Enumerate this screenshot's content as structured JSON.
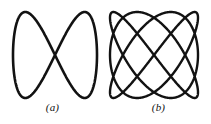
{
  "figure": {
    "background_color": "#ffffff",
    "stroke_color": "#121212",
    "panels": [
      {
        "id": "a",
        "caption": "(a)",
        "description": "figure-eight Lissajous curve",
        "stroke_width": 2.6
      },
      {
        "id": "b",
        "caption": "(b)",
        "description": "multi-loop Lissajous curve",
        "stroke_width": 2.4
      }
    ]
  },
  "chart_data": [
    {
      "type": "line",
      "title": "(a)",
      "xlabel": "",
      "ylabel": "",
      "xlim": [
        -1,
        1
      ],
      "ylim": [
        -1,
        1
      ],
      "grid": false,
      "legend": "none",
      "parametric": {
        "form": "lissajous",
        "x": "A*sin(a*t + delta)",
        "y": "B*sin(b*t)",
        "a": 1,
        "b": 2,
        "delta": 0,
        "frequency_ratio": "1:2",
        "amplitude_x": 1.0,
        "amplitude_y": 1.0,
        "t_range": [
          0,
          6.2832
        ],
        "crossings": 1
      }
    },
    {
      "type": "line",
      "title": "(b)",
      "xlabel": "",
      "ylabel": "",
      "xlim": [
        -1,
        1
      ],
      "ylim": [
        -1,
        1
      ],
      "grid": false,
      "legend": "none",
      "parametric": {
        "form": "lissajous",
        "x": "A*sin(a*t + delta)",
        "y": "B*sin(b*t)",
        "a": 3,
        "b": 4,
        "delta": 1.5708,
        "frequency_ratio": "3:4",
        "amplitude_x": 1.0,
        "amplitude_y": 1.0,
        "t_range": [
          0,
          6.2832
        ],
        "crossings": 12
      }
    }
  ]
}
